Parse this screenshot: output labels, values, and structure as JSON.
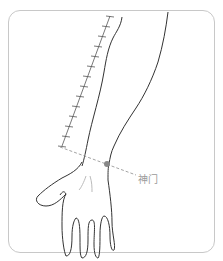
{
  "diagram": {
    "acupoint": {
      "name": "神门",
      "color": "#888888"
    },
    "ruler": {
      "tick_count": 13
    },
    "colors": {
      "outline": "#333333",
      "frame": "#c8c8c8",
      "dashed_line": "#999999",
      "label": "#9a9a9a"
    }
  }
}
